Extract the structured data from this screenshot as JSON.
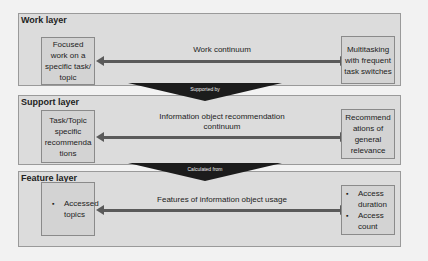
{
  "layers": [
    {
      "title": "Work layer",
      "left_box": "Focused work on a specific task/ topic",
      "right_box": "Multitasking with frequent task switches",
      "continuum_label": "Work continuum"
    },
    {
      "title": "Support layer",
      "left_box": "Task/Topic specific recommenda tions",
      "right_box": "Recommend ations of general relevance",
      "continuum_label": "Information object recommendation continuum"
    },
    {
      "title": "Feature layer",
      "left_bullets": [
        "Accessed topics"
      ],
      "right_bullets": [
        "Access duration",
        "Access count"
      ],
      "continuum_label": "Features of information object usage"
    }
  ],
  "connectors": [
    {
      "label": "Supported by"
    },
    {
      "label": "Calculated from"
    }
  ]
}
